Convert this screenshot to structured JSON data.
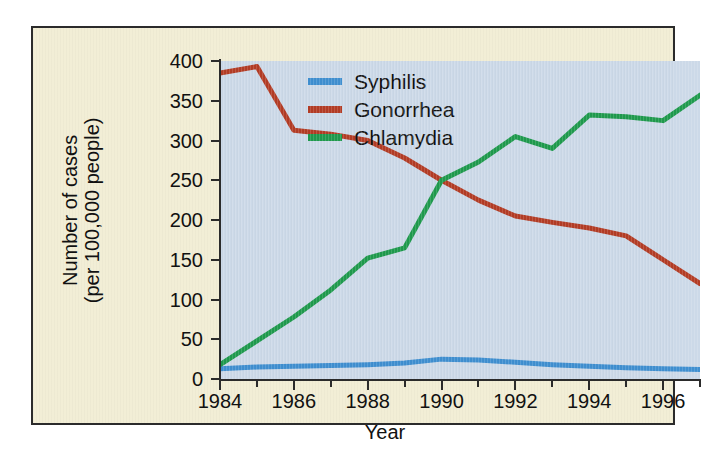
{
  "chart_data": {
    "type": "line",
    "title": "",
    "xlabel": "Year",
    "ylabel": "Number of cases\n(per 100,000 people)",
    "ylabel_line1": "Number of cases",
    "ylabel_line2": "(per 100,000 people)",
    "xlim": [
      1984,
      1997
    ],
    "ylim": [
      0,
      400
    ],
    "ytick_values": [
      0,
      50,
      100,
      150,
      200,
      250,
      300,
      350,
      400
    ],
    "ytick_labels": [
      "0",
      "50",
      "100",
      "150",
      "200",
      "250",
      "300",
      "350",
      "400"
    ],
    "xtick_values": [
      1984,
      1985,
      1986,
      1987,
      1988,
      1989,
      1990,
      1991,
      1992,
      1993,
      1994,
      1995,
      1996,
      1997
    ],
    "xtick_labels_major": [
      "1984",
      "1986",
      "1988",
      "1990",
      "1992",
      "1994",
      "1996"
    ],
    "xtick_values_major": [
      1984,
      1986,
      1988,
      1990,
      1992,
      1994,
      1996
    ],
    "grid": false,
    "legend_position": "top-center",
    "x": [
      1984,
      1985,
      1986,
      1987,
      1988,
      1989,
      1990,
      1991,
      1992,
      1993,
      1994,
      1995,
      1996,
      1997
    ],
    "series": [
      {
        "name": "Syphilis",
        "color": "#3f8fd0",
        "values": [
          13,
          15,
          16,
          17,
          18,
          20,
          25,
          24,
          21,
          18,
          16,
          14,
          13,
          12
        ]
      },
      {
        "name": "Gonorrhea",
        "color": "#b33c25",
        "values": [
          385,
          393,
          313,
          308,
          300,
          278,
          250,
          225,
          205,
          197,
          190,
          180,
          150,
          120
        ]
      },
      {
        "name": "Chlamydia",
        "color": "#1f9a4d",
        "values": [
          18,
          48,
          78,
          112,
          152,
          165,
          250,
          273,
          305,
          290,
          332,
          330,
          325,
          357
        ]
      }
    ]
  },
  "legend": {
    "items": [
      {
        "label": "Syphilis",
        "color": "#3f8fd0"
      },
      {
        "label": "Gonorrhea",
        "color": "#b33c25"
      },
      {
        "label": "Chlamydia",
        "color": "#1f9a4d"
      }
    ]
  },
  "colors": {
    "figure_background": "#f2eed6",
    "plot_background": "#ccd9e8",
    "frame_border": "#2b2b2b",
    "axis": "#2b2b2b",
    "text": "#111111",
    "page_background": "#ffffff"
  }
}
